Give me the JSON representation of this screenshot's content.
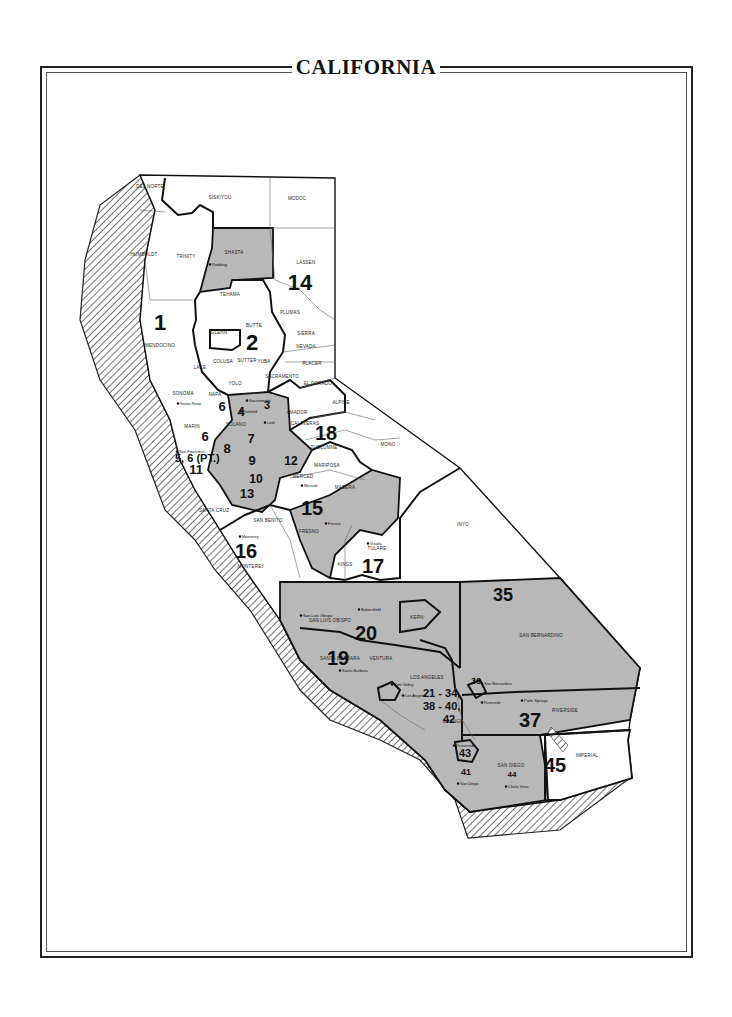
{
  "title": "CALIFORNIA",
  "colors": {
    "shaded": "#b8b8b8",
    "land": "#ffffff",
    "ink": "#111111",
    "hatch": "#333333"
  },
  "districts": [
    {
      "id": "1",
      "x": 160,
      "y": 330,
      "size": 22
    },
    {
      "id": "2",
      "x": 252,
      "y": 350,
      "size": 22
    },
    {
      "id": "14",
      "x": 300,
      "y": 290,
      "size": 22
    },
    {
      "id": "3",
      "x": 267,
      "y": 409,
      "size": 11
    },
    {
      "id": "4",
      "x": 241,
      "y": 416,
      "size": 13
    },
    {
      "id": "6",
      "x": 222,
      "y": 411,
      "size": 13
    },
    {
      "id": "6b",
      "label": "6",
      "x": 205,
      "y": 441,
      "size": 13
    },
    {
      "id": "7",
      "x": 251,
      "y": 443,
      "size": 13
    },
    {
      "id": "8",
      "x": 227,
      "y": 453,
      "size": 13
    },
    {
      "id": "9",
      "x": 252,
      "y": 465,
      "size": 13
    },
    {
      "id": "10",
      "x": 256,
      "y": 483,
      "size": 12
    },
    {
      "id": "11",
      "x": 196,
      "y": 474,
      "size": 13
    },
    {
      "id": "12",
      "x": 291,
      "y": 465,
      "size": 12
    },
    {
      "id": "13",
      "x": 247,
      "y": 498,
      "size": 13
    },
    {
      "id": "15",
      "x": 312,
      "y": 515,
      "size": 20
    },
    {
      "id": "16",
      "x": 246,
      "y": 558,
      "size": 20
    },
    {
      "id": "17",
      "x": 373,
      "y": 573,
      "size": 20
    },
    {
      "id": "18",
      "x": 326,
      "y": 440,
      "size": 20
    },
    {
      "id": "19",
      "x": 338,
      "y": 665,
      "size": 20
    },
    {
      "id": "20",
      "x": 366,
      "y": 640,
      "size": 20
    },
    {
      "id": "35",
      "x": 503,
      "y": 601,
      "size": 18
    },
    {
      "id": "36",
      "x": 476,
      "y": 684,
      "size": 9
    },
    {
      "id": "37",
      "x": 530,
      "y": 727,
      "size": 20
    },
    {
      "id": "41",
      "x": 466,
      "y": 775,
      "size": 9
    },
    {
      "id": "43",
      "x": 465,
      "y": 757,
      "size": 11
    },
    {
      "id": "44",
      "x": 512,
      "y": 777,
      "size": 8
    },
    {
      "id": "45",
      "x": 555,
      "y": 772,
      "size": 20
    }
  ],
  "district_notes": [
    {
      "text": "5, 6 (PT.)",
      "x": 175,
      "y": 462
    },
    {
      "text": "21 - 34,",
      "x": 423,
      "y": 697
    },
    {
      "text": "38 - 40,",
      "x": 423,
      "y": 710
    },
    {
      "text": "42",
      "x": 443,
      "y": 723
    }
  ],
  "counties": [
    {
      "name": "DEL NORTE",
      "x": 150,
      "y": 188
    },
    {
      "name": "SISKIYOU",
      "x": 220,
      "y": 199
    },
    {
      "name": "MODOC",
      "x": 297,
      "y": 200
    },
    {
      "name": "HUMBOLDT",
      "x": 144,
      "y": 256
    },
    {
      "name": "TRINITY",
      "x": 186,
      "y": 258
    },
    {
      "name": "SHASTA",
      "x": 234,
      "y": 254
    },
    {
      "name": "LASSEN",
      "x": 306,
      "y": 264
    },
    {
      "name": "TEHAMA",
      "x": 230,
      "y": 296
    },
    {
      "name": "PLUMAS",
      "x": 290,
      "y": 314
    },
    {
      "name": "BUTTE",
      "x": 254,
      "y": 327
    },
    {
      "name": "SIERRA",
      "x": 306,
      "y": 335
    },
    {
      "name": "GLENN",
      "x": 219,
      "y": 334
    },
    {
      "name": "NEVADA",
      "x": 306,
      "y": 348
    },
    {
      "name": "MENDOCINO",
      "x": 160,
      "y": 347
    },
    {
      "name": "COLUSA",
      "x": 223,
      "y": 363
    },
    {
      "name": "SUTTER",
      "x": 247,
      "y": 362
    },
    {
      "name": "YUBA",
      "x": 264,
      "y": 363
    },
    {
      "name": "PLACER",
      "x": 312,
      "y": 365
    },
    {
      "name": "LAKE",
      "x": 200,
      "y": 369
    },
    {
      "name": "SACRAMENTO",
      "x": 282,
      "y": 378
    },
    {
      "name": "YOLO",
      "x": 235,
      "y": 385
    },
    {
      "name": "EL DORADO",
      "x": 318,
      "y": 385
    },
    {
      "name": "SONOMA",
      "x": 183,
      "y": 395
    },
    {
      "name": "NAPA",
      "x": 215,
      "y": 396
    },
    {
      "name": "ALPINE",
      "x": 341,
      "y": 404
    },
    {
      "name": "AMADOR",
      "x": 297,
      "y": 414
    },
    {
      "name": "SOLANO",
      "x": 236,
      "y": 426
    },
    {
      "name": "CALAVERAS",
      "x": 305,
      "y": 425
    },
    {
      "name": "MARIN",
      "x": 192,
      "y": 428
    },
    {
      "name": "TUOLUMNE",
      "x": 324,
      "y": 449
    },
    {
      "name": "MONO",
      "x": 388,
      "y": 446
    },
    {
      "name": "MARIPOSA",
      "x": 327,
      "y": 467
    },
    {
      "name": "MERCED",
      "x": 303,
      "y": 478
    },
    {
      "name": "MADERA",
      "x": 345,
      "y": 489
    },
    {
      "name": "SANTA CRUZ",
      "x": 214,
      "y": 512
    },
    {
      "name": "SAN BENITO",
      "x": 268,
      "y": 522
    },
    {
      "name": "FRESNO",
      "x": 309,
      "y": 533
    },
    {
      "name": "INYO",
      "x": 463,
      "y": 526
    },
    {
      "name": "MONTEREY",
      "x": 251,
      "y": 568
    },
    {
      "name": "TULARE",
      "x": 377,
      "y": 550
    },
    {
      "name": "KINGS",
      "x": 345,
      "y": 566
    },
    {
      "name": "SAN LUIS OBISPO",
      "x": 330,
      "y": 622
    },
    {
      "name": "KERN",
      "x": 417,
      "y": 619
    },
    {
      "name": "SAN BERNARDINO",
      "x": 541,
      "y": 637
    },
    {
      "name": "SANTA BARBARA",
      "x": 340,
      "y": 660
    },
    {
      "name": "VENTURA",
      "x": 381,
      "y": 660
    },
    {
      "name": "LOS ANGELES",
      "x": 427,
      "y": 679
    },
    {
      "name": "ORANGE",
      "x": 453,
      "y": 723
    },
    {
      "name": "RIVERSIDE",
      "x": 565,
      "y": 712
    },
    {
      "name": "IMPERIAL",
      "x": 587,
      "y": 757
    },
    {
      "name": "SAN DIEGO",
      "x": 511,
      "y": 767
    }
  ],
  "cities": [
    {
      "name": "Redding",
      "x": 212,
      "y": 266
    },
    {
      "name": "Santa Rosa",
      "x": 180,
      "y": 405
    },
    {
      "name": "Sacramento",
      "x": 249,
      "y": 402
    },
    {
      "name": "Fairfield",
      "x": 243,
      "y": 413
    },
    {
      "name": "Lodi",
      "x": 267,
      "y": 424
    },
    {
      "name": "San Francisco",
      "x": 179,
      "y": 453
    },
    {
      "name": "Merced",
      "x": 304,
      "y": 487
    },
    {
      "name": "Fresno",
      "x": 328,
      "y": 525
    },
    {
      "name": "Monterey",
      "x": 242,
      "y": 538
    },
    {
      "name": "Visalia",
      "x": 370,
      "y": 545
    },
    {
      "name": "Bakersfield",
      "x": 361,
      "y": 611
    },
    {
      "name": "San Luis Obispo",
      "x": 303,
      "y": 617
    },
    {
      "name": "Santa Barbara",
      "x": 342,
      "y": 672
    },
    {
      "name": "Simi Valley",
      "x": 394,
      "y": 686
    },
    {
      "name": "Los Angeles",
      "x": 405,
      "y": 697
    },
    {
      "name": "San Bernardino",
      "x": 484,
      "y": 685
    },
    {
      "name": "Riverside",
      "x": 484,
      "y": 704
    },
    {
      "name": "Palm Springs",
      "x": 524,
      "y": 702
    },
    {
      "name": "Oceanside",
      "x": 456,
      "y": 747
    },
    {
      "name": "San Diego",
      "x": 460,
      "y": 785
    },
    {
      "name": "Chula Vista",
      "x": 508,
      "y": 788
    }
  ]
}
